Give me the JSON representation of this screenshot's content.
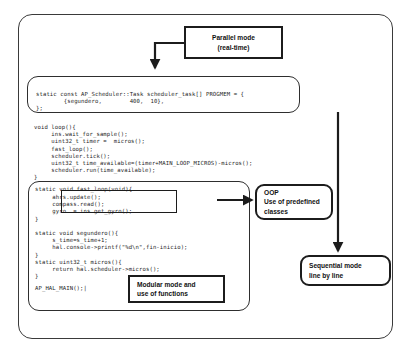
{
  "diagram": {
    "colors": {
      "stroke": "#1c1c1c",
      "frame": "#3a3a3a",
      "code_text": "#262626",
      "background": "#ffffff"
    }
  },
  "code_blocks": {
    "scheduler_task": {
      "name": "scheduler-task-table",
      "lines": "static const AP_Scheduler::Task scheduler_task[] PROGMEM = {\n        {segundero,        400,  10},\n};"
    },
    "loop": {
      "name": "void-loop-function",
      "lines": "void loop(){\n     ins.wait_for_sample();\n     uint32_t timer =  micros();\n     fast_loop();\n     scheduler.tick();\n     uint32_t time_available=(timer+MAIN_LOOP_MICROS)-micros();\n     scheduler.run(time_available);\n}"
    },
    "functions": {
      "name": "helper-functions-block",
      "fast_loop_signature": "static void fast_loop(void){",
      "fast_loop_body": "     ahrs.update();\n     compass.read();\n     gyro  = ins.get_gyro();",
      "fast_loop_close": "}",
      "segundero": "static void segundero(){\n     s_time=s_time+1;\n     hal.console->printf(\"%d\\n\",fin-inicio);\n}",
      "micros": "static uint32_t micros(){\n     return hal.scheduler->micros();\n}",
      "main_macro": "AP_HAL_MAIN();|"
    }
  },
  "annotations": {
    "parallel_mode": {
      "name": "parallel-mode-callout",
      "line1": "Parallel mode",
      "line2": "(real-time)"
    },
    "oop": {
      "name": "oop-callout",
      "line1": "OOP",
      "line2": "Use of predefined",
      "line3": "classes"
    },
    "sequential_mode": {
      "name": "sequential-mode-callout",
      "line1": "Sequential mode",
      "line2": "line by line"
    },
    "modular_mode": {
      "name": "modular-mode-callout",
      "line1": "Modular mode and",
      "line2": "use of functions"
    }
  }
}
